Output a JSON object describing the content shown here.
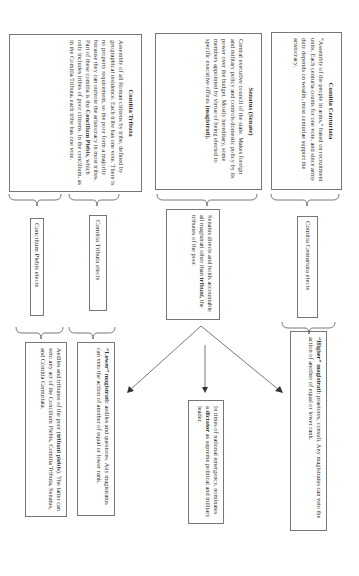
{
  "diagram": {
    "orientation": "rotated 90 degrees clockwise",
    "assemblies": {
      "centuriata": {
        "title": "Comitia Centuriata",
        "body": "“Assembly of the people in arms,” based on recruitment units. Each centuria counts for one vote, and since army duty depends on wealth, most centuriae support the aristocracy."
      },
      "senatus": {
        "title": "Senatus (Senate)",
        "body": "Central executive council of the state. Makes foreign and military policy and controls domestic policy by its power over the budget. Mostly hereditary, some members appointed by virtue of being elected to specific executive offices",
        "body_bold": "(magistrati)."
      },
      "tributa": {
        "title": "Comitia Tributa",
        "body1": "Assembly of all Roman citizens by tribe, defined by geographical residence. Each tribe has one vote. There is no property requirement, so the poor form a majority because they can outvote the aristocracy in most tribes. Part of these comitia is the",
        "body_bold": "Concilium Plebis,",
        "body2": "which only includes tribes of poor citizens. In the concilium, as in the Comitia Tributa, each tribe has one vote."
      }
    },
    "middle": {
      "centuriata_elects": "Comitia Centuriata elects",
      "senate_accountable_pre": "Senatus directs and holds accountable all magistrati other than",
      "senate_accountable_bold": "tribuni,",
      "senate_accountable_post": "the tribunes of the poor.",
      "tributa_elects": "Comitia Tributa elects",
      "concilium_elects": "Concilium Plebis elects"
    },
    "bottom": {
      "higher_bold": "“Higher” magistrati:",
      "higher_text": "praetores, consuli. Any magistratus can veto the action of another of equal or lower rank.",
      "dictator_pre": "In times of national emergency, nominates a",
      "dictator_bold": "dictator",
      "dictator_post": "as supreme political and military leader.",
      "lower_bold": "“Lower” magistrati:",
      "lower_text": "aediles and questores. Any magistratus can veto the action of another of equal or lower rank.",
      "aediles_pre": "Aediles and tribunes of the poor (",
      "aediles_bold": "tribuni plebis",
      "aediles_post": "). The latter can veto any act of the Concilium Plebis, Comitia Tributa, Senatus, and Comitia Centuriata."
    },
    "colors": {
      "border": "#777777",
      "text": "#333333",
      "background": "#ffffff"
    }
  }
}
